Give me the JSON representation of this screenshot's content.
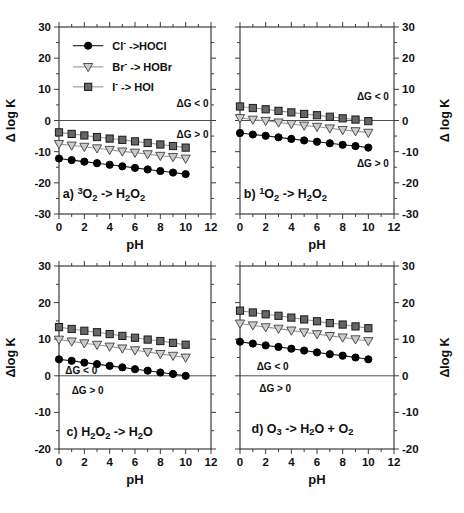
{
  "figure": {
    "background": "#ffffff",
    "axis_color": "#3c3c3c",
    "text_color": "#111111",
    "marker_styles": {
      "circle": {
        "fill": "#000000",
        "edge": "#000000",
        "line": "#1a1a1a"
      },
      "triangle-down": {
        "fill": "#cccccc",
        "edge": "#4d4d4d",
        "line": "#999999"
      },
      "square": {
        "fill": "#666666",
        "edge": "#1a1a1a",
        "line": "#999999"
      }
    }
  },
  "legend": {
    "entries": [
      {
        "label": "Cl^- ->HOCl",
        "marker": "circle"
      },
      {
        "label": "Br^- -> HOBr",
        "marker": "triangle-down"
      },
      {
        "label": "I^- -> HOI",
        "marker": "square"
      }
    ]
  },
  "chart_data": [
    {
      "id": "a",
      "type": "line",
      "title": "a) ^3O_2 -> H_2O_2",
      "xlabel": "pH",
      "ylabel": "Δ log K",
      "ylabel_side": "left",
      "xlim": [
        0,
        12
      ],
      "ylim": [
        -30,
        30
      ],
      "xticks": [
        0,
        2,
        4,
        6,
        8,
        10,
        12
      ],
      "xticks_minor": [
        1,
        3,
        5,
        7,
        9,
        11
      ],
      "yticks": [
        30,
        20,
        10,
        0,
        -10,
        -20,
        -30
      ],
      "yticks_minor": [
        25,
        15,
        5,
        -5,
        -15,
        -25
      ],
      "x": [
        0,
        1,
        2,
        3,
        4,
        5,
        6,
        7,
        8,
        9,
        10
      ],
      "series": [
        {
          "name": "Cl^- ->HOCl",
          "marker": "circle",
          "values": [
            -12.2,
            -12.7,
            -13.2,
            -13.7,
            -14.2,
            -14.7,
            -15.2,
            -15.7,
            -16.2,
            -16.7,
            -17.2
          ]
        },
        {
          "name": "Br^- -> HOBr",
          "marker": "triangle-down",
          "values": [
            -7.5,
            -8.0,
            -8.4,
            -8.9,
            -9.4,
            -9.9,
            -10.3,
            -10.8,
            -11.3,
            -11.7,
            -12.2
          ]
        },
        {
          "name": "I^- -> HOI",
          "marker": "square",
          "values": [
            -3.8,
            -4.3,
            -4.8,
            -5.3,
            -5.8,
            -6.2,
            -6.7,
            -7.2,
            -7.7,
            -8.2,
            -8.7
          ]
        }
      ],
      "zero_line": true,
      "show_legend": true,
      "annotations": [
        {
          "text": "ΔG < 0",
          "x": 11.8,
          "y": 5.6,
          "anchor": "end"
        },
        {
          "text": "ΔG > 0",
          "x": 11.8,
          "y": -4.4,
          "anchor": "end"
        }
      ]
    },
    {
      "id": "b",
      "type": "line",
      "title": "b) ^1O_2 -> H_2O_2",
      "xlabel": "pH",
      "ylabel": "Δ log K",
      "ylabel_side": "right",
      "xlim": [
        0,
        12
      ],
      "ylim": [
        -30,
        30
      ],
      "xticks": [
        0,
        2,
        4,
        6,
        8,
        10,
        12
      ],
      "xticks_minor": [
        1,
        3,
        5,
        7,
        9,
        11
      ],
      "yticks": [
        30,
        20,
        10,
        0,
        -10,
        -20,
        -30
      ],
      "yticks_minor": [
        25,
        15,
        5,
        -5,
        -15,
        -25
      ],
      "x": [
        0,
        1,
        2,
        3,
        4,
        5,
        6,
        7,
        8,
        9,
        10
      ],
      "series": [
        {
          "name": "Cl^- ->HOCl",
          "marker": "circle",
          "values": [
            -4.0,
            -4.5,
            -4.9,
            -5.4,
            -5.9,
            -6.4,
            -6.8,
            -7.3,
            -7.8,
            -8.2,
            -8.7
          ]
        },
        {
          "name": "Br^- -> HOBr",
          "marker": "triangle-down",
          "values": [
            0.8,
            0.3,
            -0.1,
            -0.6,
            -1.1,
            -1.6,
            -2.0,
            -2.5,
            -3.0,
            -3.4,
            -3.9
          ]
        },
        {
          "name": "I^- -> HOI",
          "marker": "square",
          "values": [
            4.5,
            4.0,
            3.6,
            3.1,
            2.6,
            2.1,
            1.7,
            1.2,
            0.7,
            0.3,
            -0.2
          ]
        }
      ],
      "zero_line": true,
      "show_legend": false,
      "annotations": [
        {
          "text": "ΔG < 0",
          "x": 11.6,
          "y": 7.8,
          "anchor": "end"
        },
        {
          "text": "ΔG > 0",
          "x": 11.6,
          "y": -13.9,
          "anchor": "end"
        }
      ]
    },
    {
      "id": "c",
      "type": "line",
      "title": "c) H_2O_2  -> H_2O",
      "xlabel": "pH",
      "ylabel": "Δlog K",
      "ylabel_side": "left",
      "xlim": [
        0,
        12
      ],
      "ylim": [
        -20,
        30
      ],
      "xticks": [
        0,
        2,
        4,
        6,
        8,
        10,
        12
      ],
      "xticks_minor": [
        1,
        3,
        5,
        7,
        9,
        11
      ],
      "yticks": [
        30,
        20,
        10,
        0,
        -10,
        -20
      ],
      "yticks_minor": [
        25,
        15,
        5,
        -5,
        -15
      ],
      "x": [
        0,
        1,
        2,
        3,
        4,
        5,
        6,
        7,
        8,
        9,
        10
      ],
      "series": [
        {
          "name": "Cl^- ->HOCl",
          "marker": "circle",
          "values": [
            4.5,
            4.1,
            3.6,
            3.2,
            2.7,
            2.3,
            1.8,
            1.4,
            0.9,
            0.5,
            0.0
          ]
        },
        {
          "name": "Br^- -> HOBr",
          "marker": "triangle-down",
          "values": [
            9.9,
            9.4,
            8.9,
            8.5,
            8.0,
            7.5,
            7.0,
            6.5,
            6.0,
            5.5,
            5.0
          ]
        },
        {
          "name": "I^- -> HOI",
          "marker": "square",
          "values": [
            13.3,
            12.8,
            12.3,
            11.9,
            11.4,
            10.9,
            10.4,
            9.9,
            9.5,
            9.0,
            8.5
          ]
        }
      ],
      "zero_line": true,
      "show_legend": false,
      "annotations": [
        {
          "text": "ΔG < 0",
          "x": 0.5,
          "y": 1.4,
          "anchor": "start"
        },
        {
          "text": "ΔG > 0",
          "x": 1.0,
          "y": -3.9,
          "anchor": "start"
        }
      ]
    },
    {
      "id": "d",
      "type": "line",
      "title": "d) O_3  -> H_2O + O_2",
      "xlabel": "pH",
      "ylabel": "Δlog K",
      "ylabel_side": "right",
      "xlim": [
        0,
        12
      ],
      "ylim": [
        -20,
        30
      ],
      "xticks": [
        0,
        2,
        4,
        6,
        8,
        10,
        12
      ],
      "xticks_minor": [
        1,
        3,
        5,
        7,
        9,
        11
      ],
      "yticks": [
        30,
        20,
        10,
        0,
        -10,
        -20
      ],
      "yticks_minor": [
        25,
        15,
        5,
        -5,
        -15
      ],
      "x": [
        0,
        1,
        2,
        3,
        4,
        5,
        6,
        7,
        8,
        9,
        10
      ],
      "series": [
        {
          "name": "Cl^- ->HOCl",
          "marker": "circle",
          "values": [
            9.3,
            8.8,
            8.3,
            7.9,
            7.4,
            6.9,
            6.4,
            5.9,
            5.5,
            5.0,
            4.5
          ]
        },
        {
          "name": "Br^- -> HOBr",
          "marker": "triangle-down",
          "values": [
            14.3,
            13.8,
            13.3,
            12.9,
            12.4,
            11.9,
            11.4,
            10.9,
            10.5,
            10.0,
            9.5
          ]
        },
        {
          "name": "I^- -> HOI",
          "marker": "square",
          "values": [
            17.8,
            17.3,
            16.8,
            16.4,
            15.9,
            15.4,
            14.9,
            14.4,
            14.0,
            13.5,
            13.0
          ]
        }
      ],
      "zero_line": true,
      "show_legend": false,
      "annotations": [
        {
          "text": "ΔG < 0",
          "x": 1.3,
          "y": 2.6,
          "anchor": "start"
        },
        {
          "text": "ΔG > 0",
          "x": 1.5,
          "y": -3.6,
          "anchor": "start"
        }
      ]
    }
  ]
}
